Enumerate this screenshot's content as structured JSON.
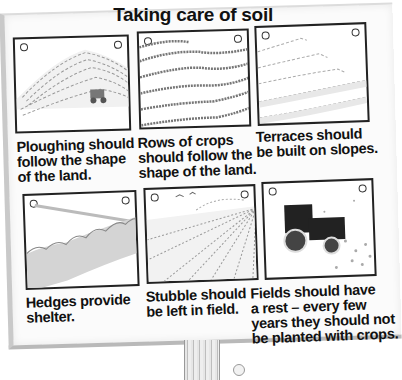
{
  "poster": {
    "title": "Taking care of soil",
    "panels": [
      {
        "id": "ploughing",
        "scene": "contour-ploughing-tractor",
        "caption_lines": [
          "Ploughing should",
          "follow the shape",
          "of the land."
        ]
      },
      {
        "id": "crop-rows",
        "scene": "contour-crop-rows",
        "caption_lines": [
          "Rows of crops",
          "should follow the",
          "shape of the land."
        ]
      },
      {
        "id": "terraces",
        "scene": "terraced-slope",
        "caption_lines": [
          "Terraces should",
          "be built on slopes."
        ]
      },
      {
        "id": "hedges",
        "scene": "hedgerow",
        "caption_lines": [
          "Hedges provide",
          "shelter."
        ]
      },
      {
        "id": "stubble",
        "scene": "stubble-field",
        "caption_lines": [
          "Stubble should",
          "be left in field."
        ]
      },
      {
        "id": "fallow",
        "scene": "tractor-fallow-field",
        "caption_lines": [
          "Fields should have",
          "a rest – every few",
          "years they should not",
          "be planted with crops."
        ]
      }
    ]
  },
  "colors": {
    "ink": "#111111",
    "paper": "#fbfbfb",
    "frame": "#222222",
    "sketch": "#888888"
  }
}
